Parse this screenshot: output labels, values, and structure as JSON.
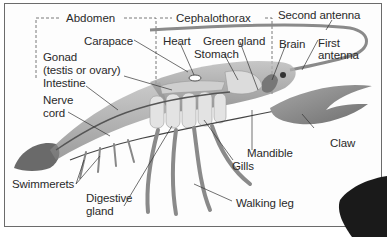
{
  "diagram": {
    "regions": [
      {
        "id": "abdomen",
        "label": "Abdomen"
      },
      {
        "id": "cephalothorax",
        "label": "Cephalothorax"
      }
    ],
    "labels": [
      {
        "id": "second-antenna",
        "text": "Second antenna"
      },
      {
        "id": "carapace",
        "text": "Carapace"
      },
      {
        "id": "heart",
        "text": "Heart"
      },
      {
        "id": "green-gland",
        "text": "Green gland"
      },
      {
        "id": "brain",
        "text": "Brain"
      },
      {
        "id": "first-antenna",
        "text": "First antenna",
        "lines": [
          "First",
          "antenna"
        ]
      },
      {
        "id": "stomach",
        "text": "Stomach"
      },
      {
        "id": "gonad",
        "text": "Gonad (testis or ovary)",
        "lines": [
          "Gonad",
          "(testis or ovary)"
        ]
      },
      {
        "id": "intestine",
        "text": "Intestine"
      },
      {
        "id": "nerve-cord",
        "text": "Nerve cord",
        "lines": [
          "Nerve",
          "cord"
        ]
      },
      {
        "id": "claw",
        "text": "Claw"
      },
      {
        "id": "mandible",
        "text": "Mandible"
      },
      {
        "id": "gills",
        "text": "Gills"
      },
      {
        "id": "swimmerets",
        "text": "Swimmerets"
      },
      {
        "id": "digestive-gland",
        "text": "Digestive gland",
        "lines": [
          "Digestive",
          "gland"
        ]
      },
      {
        "id": "walking-leg",
        "text": "Walking leg"
      }
    ],
    "colors": {
      "background": "#fdfdfd",
      "frame": "#6b6b6b",
      "text": "#2a2a2a",
      "body_shade": "#9a9a9a",
      "organ_light": "#d8d8d8",
      "dark_blob": "#1a1a1a"
    }
  }
}
